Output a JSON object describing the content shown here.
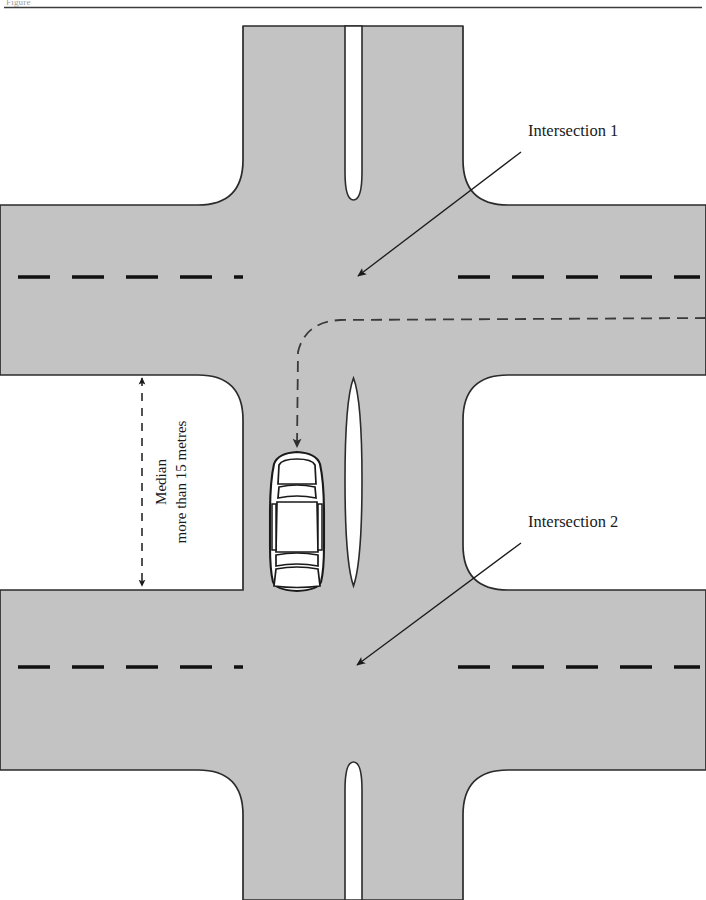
{
  "page": {
    "title_fragment": "Figure",
    "width": 706,
    "height": 900
  },
  "colors": {
    "road_fill": "#c3c3c3",
    "road_stroke": "#2b2b2b",
    "median_fill": "#ffffff",
    "lane_marking": "#111111",
    "path_dash": "#3a3a3a",
    "label_text": "#1a1a1a",
    "background": "#ffffff"
  },
  "labels": {
    "intersection_1": "Intersection 1",
    "intersection_2": "Intersection 2"
  },
  "dimension": {
    "line_1": "Median",
    "line_2": "more than 15 metres"
  },
  "diagram": {
    "elements": [
      "vertical-divided-road",
      "upper-horizontal-road",
      "lower-horizontal-road",
      "upper-median-island",
      "centre-median-island",
      "lower-median-island",
      "car-top-view",
      "turn-path-dashed",
      "median-width-dimension"
    ]
  },
  "annotations": {
    "arrow_1_tip": "Intersection 1",
    "arrow_2_tip": "Intersection 2",
    "car_direction": "southbound-entering-median-storage"
  }
}
